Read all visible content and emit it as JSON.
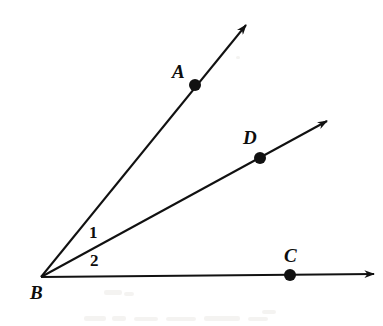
{
  "figure": {
    "kind": "geometry-diagram",
    "background_color": "#ffffff",
    "stroke_color": "#111111",
    "label_color": "#0d0d0d",
    "width": 383,
    "height": 326
  },
  "vertex": {
    "name": "B",
    "label": "B",
    "x": 41,
    "y": 277,
    "label_x": 30,
    "label_y": 283
  },
  "rays": [
    {
      "name": "ray-BA",
      "from": "B",
      "through": "A",
      "start_x": 41,
      "start_y": 277,
      "end_x": 246,
      "end_y": 25,
      "arrowhead": true,
      "stroke_width": 2.0
    },
    {
      "name": "ray-BD",
      "from": "B",
      "through": "D",
      "start_x": 41,
      "start_y": 277,
      "end_x": 327,
      "end_y": 121,
      "arrowhead": true,
      "stroke_width": 2.0
    },
    {
      "name": "ray-BC",
      "from": "B",
      "through": "C",
      "start_x": 41,
      "start_y": 277,
      "end_x": 374,
      "end_y": 274,
      "arrowhead": true,
      "stroke_width": 2.0
    }
  ],
  "points": [
    {
      "name": "point-A",
      "label": "A",
      "x": 195,
      "y": 85,
      "radius": 6,
      "label_x": 172,
      "label_y": 62
    },
    {
      "name": "point-D",
      "label": "D",
      "x": 260,
      "y": 158,
      "radius": 6,
      "label_x": 243,
      "label_y": 128
    },
    {
      "name": "point-C",
      "label": "C",
      "x": 290,
      "y": 275,
      "radius": 6,
      "label_x": 284,
      "label_y": 246
    }
  ],
  "angle_labels": [
    {
      "name": "angle-1",
      "label": "1",
      "x": 89,
      "y": 224,
      "between_rays": [
        "ray-BA",
        "ray-BD"
      ]
    },
    {
      "name": "angle-2",
      "label": "2",
      "x": 90,
      "y": 252,
      "between_rays": [
        "ray-BD",
        "ray-BC"
      ]
    }
  ],
  "smudges": [
    {
      "x": 236,
      "y": 56,
      "w": 4,
      "h": 3
    },
    {
      "x": 104,
      "y": 290,
      "w": 18,
      "h": 5
    },
    {
      "x": 124,
      "y": 292,
      "w": 10,
      "h": 4
    },
    {
      "x": 84,
      "y": 316,
      "w": 22,
      "h": 5
    },
    {
      "x": 112,
      "y": 316,
      "w": 14,
      "h": 5
    },
    {
      "x": 134,
      "y": 317,
      "w": 24,
      "h": 4
    },
    {
      "x": 166,
      "y": 317,
      "w": 30,
      "h": 4
    },
    {
      "x": 204,
      "y": 316,
      "w": 36,
      "h": 5
    },
    {
      "x": 248,
      "y": 317,
      "w": 20,
      "h": 4
    },
    {
      "x": 262,
      "y": 310,
      "w": 14,
      "h": 4
    }
  ]
}
